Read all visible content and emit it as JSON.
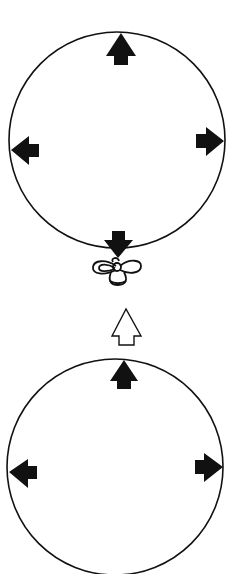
{
  "diagram": {
    "title": "",
    "background": "#ffffff",
    "stroke_color": "#111111",
    "fill_color": "#111111",
    "inflated_balloon": {
      "label": "",
      "shape": "circle",
      "center": [
        117,
        140
      ],
      "radius": 108,
      "tied_knot": true,
      "pressure_arrows": [
        {
          "direction": "up",
          "position": "top",
          "style": "filled",
          "pointing": "outward"
        },
        {
          "direction": "left",
          "position": "left",
          "style": "filled",
          "pointing": "outward"
        },
        {
          "direction": "right",
          "position": "right",
          "style": "filled",
          "pointing": "outward"
        },
        {
          "direction": "down",
          "position": "bottom",
          "style": "filled",
          "pointing": "outward"
        }
      ]
    },
    "transition_arrow": {
      "direction": "up",
      "style": "outline",
      "label": ""
    },
    "open_balloon": {
      "label": "",
      "shape": "circle",
      "center": [
        115,
        467
      ],
      "radius": 108,
      "tied_knot": false,
      "cropped_at_bottom": true,
      "pressure_arrows": [
        {
          "direction": "up",
          "position": "top",
          "style": "filled",
          "pointing": "outward"
        },
        {
          "direction": "left",
          "position": "left",
          "style": "filled",
          "pointing": "outward"
        },
        {
          "direction": "right",
          "position": "right",
          "style": "filled",
          "pointing": "outward"
        }
      ]
    }
  }
}
